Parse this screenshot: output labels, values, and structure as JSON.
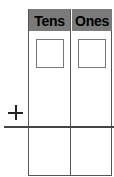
{
  "place_value_chart": {
    "columns": [
      {
        "label": "Tens",
        "top_value": "",
        "bottom_value": ""
      },
      {
        "label": "Ones",
        "top_value": "",
        "bottom_value": ""
      }
    ],
    "operator": "+",
    "header_color": "#7a7a7a"
  }
}
